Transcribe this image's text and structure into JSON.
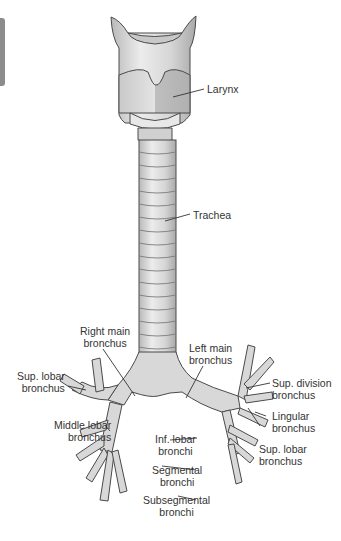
{
  "figure": {
    "colors": {
      "background": "#ffffff",
      "tissue_fill": "#dcdcdc",
      "tissue_shadow": "#bdbdbd",
      "outline": "#4a4a4a",
      "label_text": "#333333",
      "edge_tab": "#8c8c8c"
    },
    "labels": {
      "larynx": {
        "line1": "Larynx"
      },
      "trachea": {
        "line1": "Trachea"
      },
      "right_main_bronchus": {
        "line1": "Right main",
        "line2": "bronchus"
      },
      "left_main_bronchus": {
        "line1": "Left main",
        "line2": "bronchus"
      },
      "right_sup_lobar_bronchus": {
        "line1": "Sup. lobar",
        "line2": "bronchus"
      },
      "sup_division_bronchus": {
        "line1": "Sup. division",
        "line2": "bronchus"
      },
      "middle_lobar_bronchus": {
        "line1": "Middle lobar",
        "line2": "bronchus"
      },
      "lingular_bronchus": {
        "line1": "Lingular",
        "line2": "bronchus"
      },
      "inf_lobar_bronchi": {
        "line1": "Inf. lobar",
        "line2": "bronchi"
      },
      "left_sup_lobar_bronchus": {
        "line1": "Sup. lobar",
        "line2": "bronchus"
      },
      "segmental_bronchi": {
        "line1": "Segmental",
        "line2": "bronchi"
      },
      "subsegmental_bronchi": {
        "line1": "Subsegmental",
        "line2": "bronchi"
      }
    }
  }
}
